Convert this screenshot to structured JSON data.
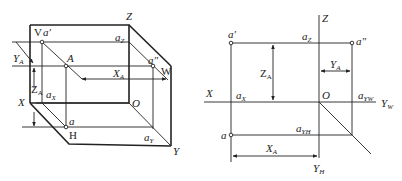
{
  "left_diagram": {
    "title": "three-plane projection (axonometric)",
    "planes": {
      "V": "V",
      "H": "H",
      "W": "W"
    },
    "axes": {
      "X": "X",
      "Y": "Y",
      "Z": "Z",
      "O": "O"
    },
    "points": {
      "A": "A",
      "a_prime": "a′",
      "a_double_prime": "a″",
      "a": "a",
      "aX": "a",
      "aX_sub": "X",
      "aY": "a",
      "aY_sub": "Y",
      "aZ": "a",
      "aZ_sub": "Z"
    },
    "dimensions": {
      "XA": "X",
      "XA_sub": "A",
      "YA": "Y",
      "YA_sub": "A",
      "ZA": "Z",
      "ZA_sub": "A"
    }
  },
  "right_diagram": {
    "title": "orthographic projection (unfolded)",
    "axes": {
      "X": "X",
      "Z": "Z",
      "O": "O",
      "YW": "Y",
      "YW_sub": "W",
      "YH": "Y",
      "YH_sub": "H"
    },
    "points": {
      "a_prime": "a′",
      "a_double_prime": "a″",
      "a": "a",
      "aX": "a",
      "aX_sub": "X",
      "aZ": "a",
      "aZ_sub": "Z",
      "aYW": "a",
      "aYW_sub": "YW",
      "aYH": "a",
      "aYH_sub": "YH"
    },
    "dimensions": {
      "XA": "X",
      "XA_sub": "A",
      "YA": "Y",
      "YA_sub": "A",
      "ZA": "Z",
      "ZA_sub": "A"
    }
  },
  "colors": {
    "line": "#222222",
    "background": "#ffffff"
  }
}
